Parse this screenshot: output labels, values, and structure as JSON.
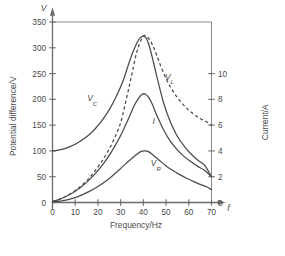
{
  "chart_data": {
    "type": "line",
    "title": "",
    "xlabel": "Frequency/Hz",
    "ylabel": "Potential difference/V",
    "y2label": "Current/A",
    "x_symbol": "f",
    "y_symbol": "V",
    "xlim": [
      0,
      75
    ],
    "ylim": [
      0,
      370
    ],
    "y2lim": [
      0,
      14.8
    ],
    "xticks": [
      0,
      10,
      20,
      30,
      40,
      50,
      60,
      70
    ],
    "xtick_labels": [
      "0",
      "10",
      "20",
      "30",
      "40",
      "50",
      "60",
      "70"
    ],
    "yticks": [
      0,
      50,
      100,
      150,
      200,
      250,
      300,
      350
    ],
    "ytick_labels": [
      "0",
      "50",
      "100",
      "150",
      "200",
      "250",
      "300",
      "350"
    ],
    "y2ticks": [
      0,
      2,
      4,
      6,
      8,
      10
    ],
    "y2tick_labels": [
      "0",
      "2",
      "4",
      "6",
      "8",
      "10"
    ],
    "grid": false,
    "legend_position": "inline-labels",
    "frame_top_y": 350,
    "frame_right_x": 70,
    "series": [
      {
        "name": "V_C",
        "label": "V",
        "label_sub": "C",
        "style": "solid",
        "axis": "left",
        "label_x": 17.5,
        "label_y": 196,
        "x": [
          0,
          2,
          5,
          8,
          10,
          13,
          16,
          19,
          22,
          25,
          28,
          31,
          34,
          36,
          38,
          39.5,
          41,
          42.5,
          44,
          46,
          49,
          52,
          55,
          58,
          61,
          64,
          67,
          70
        ],
        "y": [
          100,
          101,
          104,
          109,
          113,
          121,
          131,
          144,
          160,
          180,
          205,
          235,
          275,
          298,
          316,
          322,
          320,
          305,
          280,
          243,
          192,
          155,
          128,
          109,
          94,
          82,
          72,
          50
        ]
      },
      {
        "name": "V_L",
        "label": "V",
        "label_sub": "L",
        "style": "dashed",
        "axis": "left",
        "label_x": 51.5,
        "label_y": 238,
        "x": [
          0,
          3,
          6,
          9,
          12,
          15,
          18,
          21,
          24,
          27,
          30,
          33,
          35,
          37,
          39,
          40.5,
          42,
          43.5,
          45,
          47,
          50,
          53,
          56,
          59,
          62,
          65,
          68,
          70
        ],
        "y": [
          2,
          6,
          12,
          20,
          30,
          42,
          57,
          75,
          96,
          122,
          155,
          210,
          250,
          290,
          315,
          324,
          320,
          310,
          296,
          272,
          240,
          216,
          198,
          183,
          172,
          163,
          156,
          150
        ]
      },
      {
        "name": "I",
        "label": "I",
        "label_sub": "",
        "style": "solid",
        "axis": "right",
        "label_x": 44.5,
        "label_y": 152,
        "x": [
          0,
          3,
          6,
          9,
          12,
          15,
          18,
          21,
          24,
          27,
          30,
          33,
          36,
          38,
          39.5,
          41,
          42.5,
          44,
          46,
          49,
          52,
          55,
          58,
          61,
          64,
          67,
          70
        ],
        "y": [
          2,
          6,
          12,
          19,
          28,
          39,
          52,
          67,
          85,
          106,
          130,
          158,
          188,
          203,
          210,
          210,
          203,
          190,
          168,
          140,
          118,
          102,
          89,
          79,
          70,
          62,
          50
        ]
      },
      {
        "name": "V_R",
        "label": "V",
        "label_sub": "R",
        "style": "solid",
        "axis": "left",
        "label_x": 45.5,
        "label_y": 70,
        "x": [
          0,
          4,
          8,
          12,
          16,
          20,
          24,
          28,
          31,
          34,
          37,
          39,
          40.5,
          42,
          44,
          47,
          50,
          53,
          56,
          59,
          62,
          65,
          68,
          70
        ],
        "y": [
          1,
          3,
          7,
          13,
          21,
          31,
          43,
          58,
          70,
          82,
          93,
          99,
          100,
          99,
          93,
          82,
          71,
          62,
          54,
          47,
          41,
          35,
          30,
          25
        ]
      }
    ]
  }
}
